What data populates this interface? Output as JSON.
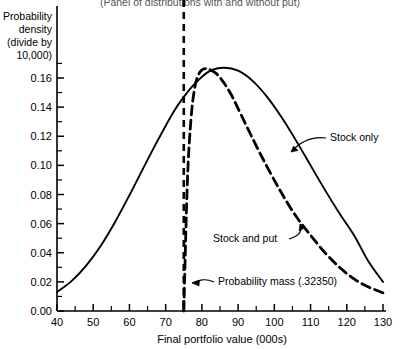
{
  "chart_data": {
    "type": "line",
    "title": "(Panel of distributions with and without put)",
    "xlabel": "Final portfolio value (000s)",
    "ylabel": "Probability density (divide by 10,000)",
    "ylabel_lines": [
      "Probability",
      "density",
      "(divide by",
      "10,000)"
    ],
    "xlim": [
      40,
      130
    ],
    "ylim": [
      0.0,
      0.175
    ],
    "xticks": [
      40,
      50,
      60,
      70,
      80,
      90,
      100,
      110,
      120,
      130
    ],
    "xtick_labels": [
      "40",
      "50",
      "60",
      "70",
      "80",
      "90",
      "100",
      "110",
      "120",
      "130"
    ],
    "yticks": [
      0.0,
      0.02,
      0.04,
      0.06,
      0.08,
      0.1,
      0.12,
      0.14,
      0.16
    ],
    "ytick_labels": [
      "0.00",
      "0.02",
      "0.04",
      "0.06",
      "0.08",
      "0.10",
      "0.12",
      "0.14",
      "0.16"
    ],
    "x_minor_ticks": [
      45,
      55,
      65,
      75,
      85,
      95,
      105,
      115,
      125
    ],
    "y_minor_ticks": [
      0.01,
      0.03,
      0.05,
      0.07,
      0.09,
      0.11,
      0.13,
      0.15,
      0.17
    ],
    "grid": false,
    "legend_position": "inline-annotations",
    "series": [
      {
        "name": "Stock only",
        "style": "solid",
        "color": "#000000",
        "x": [
          40,
          44,
          48,
          52,
          56,
          60,
          64,
          68,
          72,
          75,
          78,
          82,
          86,
          90,
          94,
          98,
          102,
          106,
          110,
          114,
          118,
          122,
          126,
          130
        ],
        "values": [
          0.013,
          0.0205,
          0.031,
          0.0445,
          0.061,
          0.0795,
          0.099,
          0.118,
          0.136,
          0.147,
          0.156,
          0.1645,
          0.167,
          0.165,
          0.158,
          0.147,
          0.133,
          0.117,
          0.1,
          0.083,
          0.067,
          0.052,
          0.034,
          0.02
        ]
      },
      {
        "name": "Stock and put",
        "style": "dashed",
        "color": "#000000",
        "x": [
          75,
          76,
          77,
          78,
          79,
          80,
          81,
          82,
          84,
          86,
          88,
          90,
          94,
          98,
          102,
          106,
          110,
          114,
          118,
          122,
          126,
          130
        ],
        "values": [
          0.0,
          0.089,
          0.132,
          0.153,
          0.162,
          0.1655,
          0.1665,
          0.166,
          0.163,
          0.157,
          0.149,
          0.139,
          0.1185,
          0.099,
          0.081,
          0.065,
          0.052,
          0.04,
          0.03,
          0.022,
          0.0165,
          0.0125
        ]
      }
    ],
    "reference_lines": [
      {
        "name": "exercise-price-line",
        "orientation": "vertical",
        "value": 75,
        "style": "dashed",
        "color": "#000000"
      }
    ],
    "annotations": [
      {
        "id": "stock-only",
        "text": "Stock only",
        "text_x": 330,
        "text_y": 141,
        "anchor": "start",
        "leader": "M 326 138 C 312 136 300 142 291 152"
      },
      {
        "id": "stock-and-put",
        "text": "Stock and put",
        "text_x": 213,
        "text_y": 242,
        "anchor": "start",
        "leader": "M 289 239 C 300 236 303 230 300 224"
      },
      {
        "id": "probability-mass",
        "text": "Probability mass (.32350)",
        "text_x": 218,
        "text_y": 285,
        "anchor": "start",
        "leader": "M 214 282 C 205 278 199 280 192 283"
      }
    ]
  }
}
